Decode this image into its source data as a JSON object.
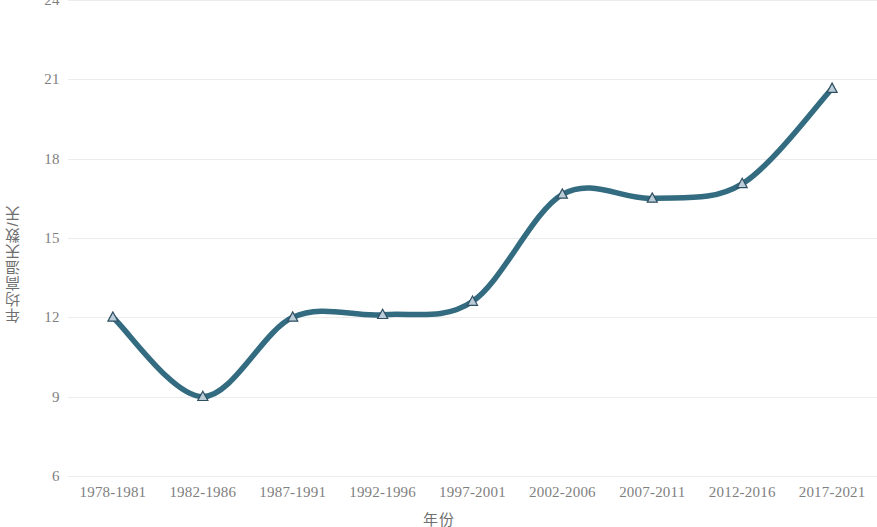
{
  "chart_data": {
    "type": "line",
    "title": "",
    "subtitle": "",
    "xlabel": "年份",
    "ylabel": "年均高温天数/天",
    "categories": [
      "1978-1981",
      "1982-1986",
      "1987-1991",
      "1992-1996",
      "1997-2001",
      "2002-2006",
      "2007-2011",
      "2012-2016",
      "2017-2021"
    ],
    "values": [
      12.0,
      9.0,
      12.0,
      12.1,
      12.6,
      16.65,
      16.5,
      17.05,
      20.65
    ],
    "series": [
      {
        "name": "年均高温天数",
        "values": [
          12.0,
          9.0,
          12.0,
          12.1,
          12.6,
          16.65,
          16.5,
          17.05,
          20.65
        ]
      }
    ],
    "ylim": [
      6,
      24
    ],
    "yticks": [
      6,
      9,
      12,
      15,
      18,
      21,
      24
    ],
    "ytick_labels": [
      "6",
      "9",
      "12",
      "15",
      "18",
      "21",
      "24"
    ],
    "grid": "horizontal",
    "legend": "none",
    "smoothing": "spline",
    "marker": "triangle",
    "line_color": "#336B80",
    "marker_fill": "#b9ccd8",
    "marker_stroke": "#2f4f63",
    "grid_color": "#ececec",
    "tick_color": "#7f7f7f",
    "axis_title_color": "#6f6f6f",
    "background": "#ffffff"
  }
}
